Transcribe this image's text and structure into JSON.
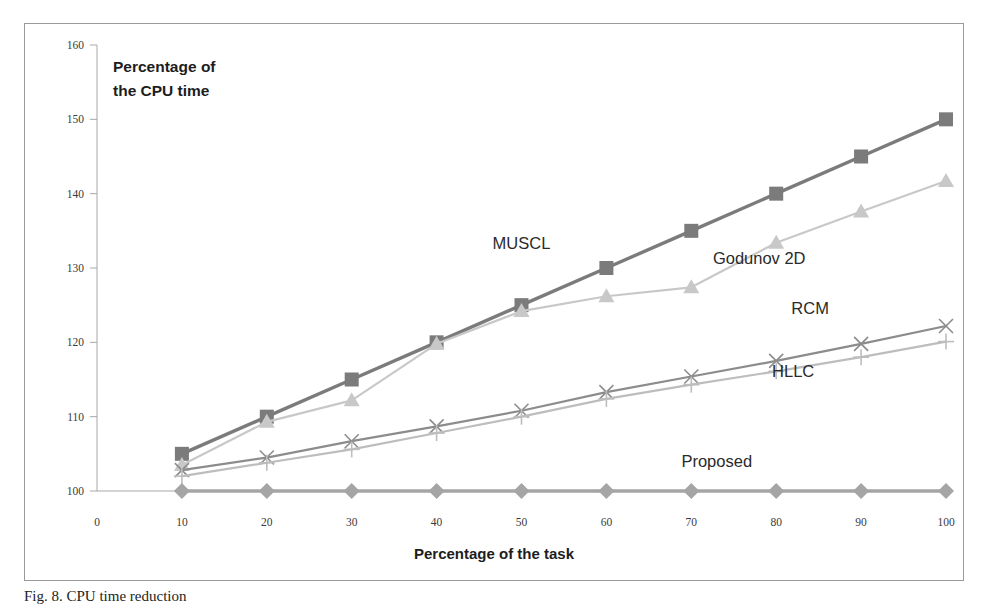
{
  "figure": {
    "caption": "Fig. 8. CPU time reduction",
    "note": "Percentage of the CPU time",
    "note_line1": "Percentage of",
    "note_line2": "the CPU time"
  },
  "chart_data": {
    "type": "line",
    "title": "",
    "xlabel": "Percentage of the task",
    "ylabel": "Percentage of the CPU time",
    "xlim": [
      0,
      100
    ],
    "ylim": [
      100,
      160
    ],
    "xticks": [
      0,
      10,
      20,
      30,
      40,
      50,
      60,
      70,
      80,
      90,
      100
    ],
    "yticks": [
      100,
      110,
      120,
      130,
      140,
      150,
      160
    ],
    "grid": false,
    "legend_position": "inline-annotations",
    "x": [
      10,
      20,
      30,
      40,
      50,
      60,
      70,
      80,
      90,
      100
    ],
    "series": [
      {
        "name": "MUSCL",
        "marker": "square",
        "color": "#7b7b7b",
        "label_x": 50,
        "label_y": 132.5,
        "values": [
          105,
          110,
          115,
          120,
          125,
          130,
          135,
          140,
          145,
          150
        ]
      },
      {
        "name": "Godunov 2D",
        "marker": "triangle",
        "color": "#c8c8c8",
        "label_x": 78,
        "label_y": 130.5,
        "values": [
          103.5,
          109.3,
          112.2,
          119.8,
          124.2,
          126.2,
          127.4,
          133.4,
          137.6,
          141.7
        ]
      },
      {
        "name": "RCM",
        "marker": "cross-x",
        "color": "#8c8c8c",
        "label_x": 84,
        "label_y": 123.8,
        "values": [
          102.8,
          104.5,
          106.7,
          108.7,
          110.8,
          113.3,
          115.4,
          117.5,
          119.8,
          122.2
        ]
      },
      {
        "name": "HLLC",
        "marker": "plus",
        "color": "#bdbdbd",
        "label_x": 82,
        "label_y": 115.3,
        "values": [
          102.0,
          103.8,
          105.6,
          107.8,
          110.0,
          112.4,
          114.3,
          116.1,
          118.0,
          120.1
        ]
      },
      {
        "name": "Proposed",
        "marker": "diamond",
        "color": "#a5a5a5",
        "label_x": 73,
        "label_y": 103.2,
        "values": [
          100,
          100,
          100,
          100,
          100,
          100,
          100,
          100,
          100,
          100
        ]
      }
    ]
  },
  "colors": {
    "frame": "#9a9a9a",
    "axis": "#a8a8a8",
    "tick_text": "#3a3a3a",
    "background": "#ffffff"
  }
}
